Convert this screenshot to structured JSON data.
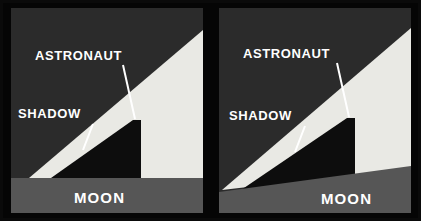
{
  "figure": {
    "panel_count": 2
  },
  "colors": {
    "frame": "#050505",
    "sky": "#2b2b2b",
    "sunlit": "#e9e9e4",
    "shadow": "#0d0d0d",
    "ground": "#565656",
    "label": "#ffffff",
    "leader_line": "#ffffff"
  },
  "panels": [
    {
      "id": "panel-left",
      "name": "flat-ground-panel",
      "ground_type": "flat",
      "labels": {
        "astronaut": "ASTRONAUT",
        "shadow": "SHADOW",
        "moon": "MOON"
      }
    },
    {
      "id": "panel-right",
      "name": "sloped-ground-panel",
      "ground_type": "sloped",
      "labels": {
        "astronaut": "ASTRONAUT",
        "shadow": "SHADOW",
        "moon": "MOON"
      }
    }
  ]
}
